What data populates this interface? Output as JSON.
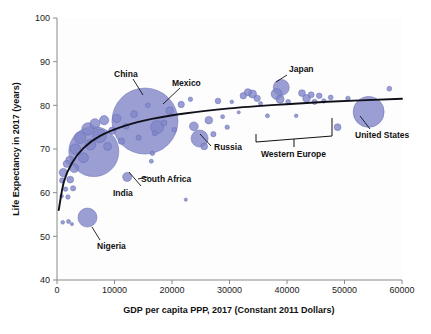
{
  "chart_data": {
    "type": "scatter",
    "title": "",
    "xlabel": "GDP per capita PPP, 2017 (Constant 2011 Dollars)",
    "ylabel": "Life Expectancy in 2017 (years)",
    "xlim": [
      0,
      60000
    ],
    "ylim": [
      40,
      100
    ],
    "xticks": [
      0,
      10000,
      20000,
      30000,
      40000,
      50000,
      60000
    ],
    "yticks": [
      40,
      50,
      60,
      70,
      80,
      90,
      100
    ],
    "xtick_labels": [
      "0",
      "10000",
      "20000",
      "30000",
      "40000",
      "50000",
      "60000"
    ],
    "ytick_labels": [
      "40",
      "50",
      "60",
      "70",
      "80",
      "90",
      "100"
    ],
    "grid": false,
    "legend": "none",
    "bubble_color": "#8186c8",
    "bubble_edge_color": "#6a70b8",
    "trendline_color": "#10101a",
    "size_encoding": "population",
    "points": [
      {
        "label": "China",
        "x": 15300,
        "y": 76.4,
        "r": 33.0
      },
      {
        "label": "India",
        "x": 6400,
        "y": 69.4,
        "r": 25.0
      },
      {
        "label": "United States",
        "x": 54200,
        "y": 78.5,
        "r": 15.5
      },
      {
        "label": "Nigeria",
        "x": 5300,
        "y": 54.3,
        "r": 9.5
      },
      {
        "label": "Japan",
        "x": 39000,
        "y": 84.1,
        "r": 8.0
      },
      {
        "label": "Russia",
        "x": 24800,
        "y": 72.4,
        "r": 8.5
      },
      {
        "label": "Mexico",
        "x": 17400,
        "y": 75.0,
        "r": 6.5
      },
      {
        "label": "South Africa",
        "x": 12200,
        "y": 63.6,
        "r": 4.5
      },
      {
        "label": "",
        "x": 1100,
        "y": 64.6,
        "r": 4.2
      },
      {
        "label": "",
        "x": 1700,
        "y": 66.6,
        "r": 3.6
      },
      {
        "label": "",
        "x": 900,
        "y": 62.8,
        "r": 2.6
      },
      {
        "label": "",
        "x": 1500,
        "y": 60.8,
        "r": 2.2
      },
      {
        "label": "",
        "x": 2300,
        "y": 63.0,
        "r": 3.4
      },
      {
        "label": "",
        "x": 2200,
        "y": 67.4,
        "r": 4.0
      },
      {
        "label": "",
        "x": 3200,
        "y": 70.0,
        "r": 5.2
      },
      {
        "label": "",
        "x": 3000,
        "y": 65.6,
        "r": 4.4
      },
      {
        "label": "",
        "x": 4000,
        "y": 72.6,
        "r": 5.8
      },
      {
        "label": "",
        "x": 4600,
        "y": 68.0,
        "r": 5.0
      },
      {
        "label": "",
        "x": 5400,
        "y": 74.6,
        "r": 6.2
      },
      {
        "label": "",
        "x": 5800,
        "y": 71.0,
        "r": 5.4
      },
      {
        "label": "",
        "x": 6600,
        "y": 75.8,
        "r": 5.0
      },
      {
        "label": "",
        "x": 7400,
        "y": 73.0,
        "r": 6.8
      },
      {
        "label": "",
        "x": 8200,
        "y": 76.6,
        "r": 4.6
      },
      {
        "label": "",
        "x": 8800,
        "y": 70.6,
        "r": 4.0
      },
      {
        "label": "",
        "x": 9600,
        "y": 74.2,
        "r": 3.6
      },
      {
        "label": "",
        "x": 10400,
        "y": 77.0,
        "r": 4.2
      },
      {
        "label": "",
        "x": 11200,
        "y": 71.8,
        "r": 3.2
      },
      {
        "label": "",
        "x": 12000,
        "y": 75.2,
        "r": 3.0
      },
      {
        "label": "",
        "x": 13400,
        "y": 78.0,
        "r": 3.4
      },
      {
        "label": "",
        "x": 14200,
        "y": 72.6,
        "r": 2.6
      },
      {
        "label": "",
        "x": 15800,
        "y": 80.0,
        "r": 2.4
      },
      {
        "label": "",
        "x": 16600,
        "y": 69.0,
        "r": 2.2
      },
      {
        "label": "",
        "x": 16400,
        "y": 67.2,
        "r": 2.0
      },
      {
        "label": "",
        "x": 17000,
        "y": 73.6,
        "r": 2.6
      },
      {
        "label": "",
        "x": 18600,
        "y": 76.0,
        "r": 3.0
      },
      {
        "label": "",
        "x": 19600,
        "y": 78.8,
        "r": 3.8
      },
      {
        "label": "",
        "x": 20400,
        "y": 74.4,
        "r": 2.4
      },
      {
        "label": "",
        "x": 21600,
        "y": 80.2,
        "r": 3.2
      },
      {
        "label": "",
        "x": 22400,
        "y": 58.4,
        "r": 1.6
      },
      {
        "label": "",
        "x": 23200,
        "y": 81.4,
        "r": 2.2
      },
      {
        "label": "",
        "x": 23800,
        "y": 75.2,
        "r": 4.4
      },
      {
        "label": "",
        "x": 25600,
        "y": 70.6,
        "r": 3.4
      },
      {
        "label": "",
        "x": 26400,
        "y": 76.6,
        "r": 3.8
      },
      {
        "label": "",
        "x": 27200,
        "y": 73.4,
        "r": 2.6
      },
      {
        "label": "",
        "x": 28000,
        "y": 81.0,
        "r": 2.8
      },
      {
        "label": "",
        "x": 28800,
        "y": 77.4,
        "r": 2.0
      },
      {
        "label": "",
        "x": 29600,
        "y": 75.0,
        "r": 2.2
      },
      {
        "label": "",
        "x": 30400,
        "y": 80.8,
        "r": 1.8
      },
      {
        "label": "",
        "x": 31600,
        "y": 78.4,
        "r": 1.6
      },
      {
        "label": "",
        "x": 32400,
        "y": 82.2,
        "r": 3.2
      },
      {
        "label": "",
        "x": 33200,
        "y": 83.0,
        "r": 3.6
      },
      {
        "label": "",
        "x": 34000,
        "y": 82.6,
        "r": 4.0
      },
      {
        "label": "",
        "x": 34800,
        "y": 81.6,
        "r": 3.2
      },
      {
        "label": "",
        "x": 35400,
        "y": 80.4,
        "r": 2.0
      },
      {
        "label": "",
        "x": 36600,
        "y": 77.6,
        "r": 2.0
      },
      {
        "label": "",
        "x": 38200,
        "y": 82.6,
        "r": 5.5
      },
      {
        "label": "",
        "x": 38800,
        "y": 81.4,
        "r": 4.0
      },
      {
        "label": "",
        "x": 40200,
        "y": 80.8,
        "r": 2.4
      },
      {
        "label": "",
        "x": 41600,
        "y": 77.6,
        "r": 1.8
      },
      {
        "label": "",
        "x": 42600,
        "y": 82.8,
        "r": 3.4
      },
      {
        "label": "",
        "x": 43400,
        "y": 81.6,
        "r": 3.8
      },
      {
        "label": "",
        "x": 44200,
        "y": 82.4,
        "r": 3.0
      },
      {
        "label": "",
        "x": 44800,
        "y": 80.8,
        "r": 2.6
      },
      {
        "label": "",
        "x": 45600,
        "y": 82.2,
        "r": 2.8
      },
      {
        "label": "",
        "x": 46400,
        "y": 81.0,
        "r": 2.2
      },
      {
        "label": "",
        "x": 47600,
        "y": 81.8,
        "r": 2.4
      },
      {
        "label": "",
        "x": 48800,
        "y": 75.0,
        "r": 3.4
      },
      {
        "label": "",
        "x": 50600,
        "y": 81.6,
        "r": 2.2
      },
      {
        "label": "",
        "x": 57800,
        "y": 83.8,
        "r": 2.4
      },
      {
        "label": "",
        "x": 1000,
        "y": 53.2,
        "r": 1.8
      },
      {
        "label": "",
        "x": 2000,
        "y": 53.4,
        "r": 2.0
      },
      {
        "label": "",
        "x": 2600,
        "y": 52.8,
        "r": 1.6
      },
      {
        "label": "",
        "x": 800,
        "y": 59.2,
        "r": 1.8
      },
      {
        "label": "",
        "x": 1900,
        "y": 59.0,
        "r": 2.2
      },
      {
        "label": "",
        "x": 2800,
        "y": 61.0,
        "r": 2.6
      }
    ],
    "trendline": {
      "description": "logarithmic fit",
      "points": [
        {
          "x": 300,
          "y": 56.0
        },
        {
          "x": 1200,
          "y": 62.5
        },
        {
          "x": 2600,
          "y": 66.8
        },
        {
          "x": 4600,
          "y": 70.2
        },
        {
          "x": 7500,
          "y": 73.0
        },
        {
          "x": 11500,
          "y": 75.2
        },
        {
          "x": 16500,
          "y": 76.9
        },
        {
          "x": 22500,
          "y": 78.2
        },
        {
          "x": 30000,
          "y": 79.3
        },
        {
          "x": 38000,
          "y": 80.1
        },
        {
          "x": 47000,
          "y": 80.8
        },
        {
          "x": 60000,
          "y": 81.5
        }
      ]
    },
    "annotations": [
      {
        "name": "china",
        "text": "China"
      },
      {
        "name": "mexico",
        "text": "Mexico"
      },
      {
        "name": "japan",
        "text": "Japan"
      },
      {
        "name": "united-states",
        "text": "United States"
      },
      {
        "name": "russia",
        "text": "Russia"
      },
      {
        "name": "western-europe",
        "text": "Western Europe"
      },
      {
        "name": "south-africa",
        "text": "South Africa"
      },
      {
        "name": "india",
        "text": "India"
      },
      {
        "name": "nigeria",
        "text": "Nigeria"
      }
    ]
  },
  "labels": {
    "china": "China",
    "mexico": "Mexico",
    "japan": "Japan",
    "united_states": "United States",
    "russia": "Russia",
    "western_europe": "Western Europe",
    "south_africa": "South Africa",
    "india": "India",
    "nigeria": "Nigeria"
  },
  "axes": {
    "x_title": "GDP per capita PPP, 2017 (Constant 2011 Dollars)",
    "y_title": "Life Expectancy in 2017 (years)",
    "x_ticks": [
      "0",
      "10000",
      "20000",
      "30000",
      "40000",
      "50000",
      "60000"
    ],
    "y_ticks": [
      "100",
      "90",
      "80",
      "70",
      "60",
      "50",
      "40"
    ]
  }
}
